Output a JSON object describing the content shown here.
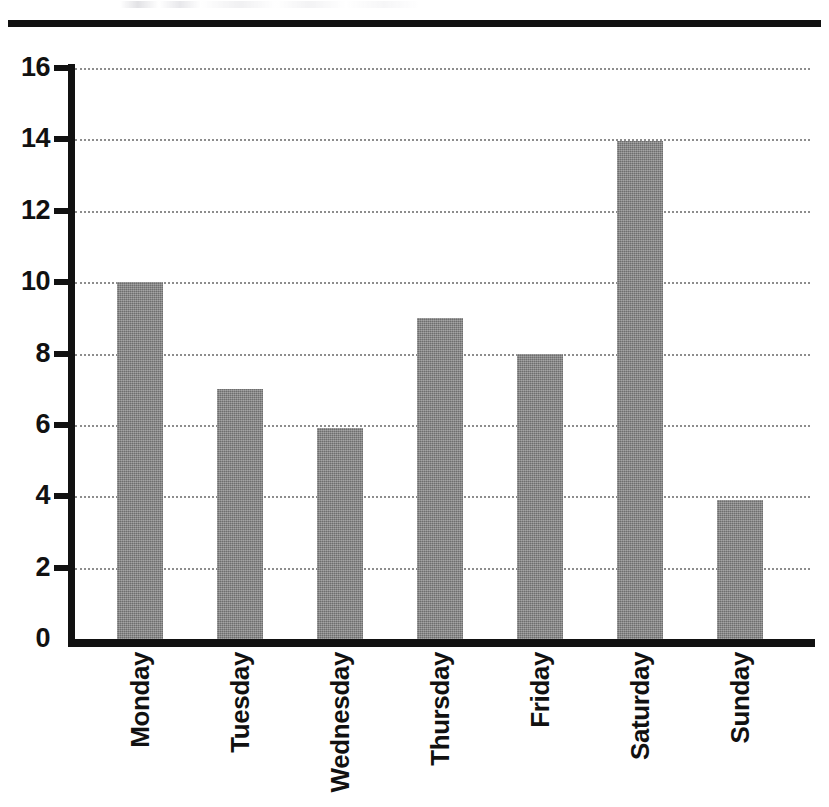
{
  "page": {
    "top_rule": "horizontal-rule",
    "background_color": "#ffffff"
  },
  "chart_data": {
    "type": "bar",
    "title": "",
    "subtitle": "",
    "xlabel": "",
    "ylabel": "",
    "categories": [
      "Monday",
      "Tuesday",
      "Wednesday",
      "Thursday",
      "Friday",
      "Saturday",
      "Sunday"
    ],
    "values": [
      10,
      7,
      5.9,
      9,
      8,
      13.95,
      3.9
    ],
    "value_labels": [
      "10",
      "7",
      "5.9",
      "9",
      "8",
      "13.95",
      "3.9"
    ],
    "ylim": [
      0,
      16
    ],
    "y_ticks": [
      0,
      2,
      4,
      6,
      8,
      10,
      12,
      14,
      16
    ],
    "y_tick_labels": [
      "0",
      "2",
      "4",
      "6",
      "8",
      "10",
      "12",
      "14",
      "16"
    ],
    "grid": true,
    "grid_axis": "y",
    "grid_style": "dotted",
    "grid_color": "#8d8d8d",
    "legend": false,
    "legend_position": "none",
    "bar_color": "#808080",
    "axis_color": "#111111",
    "tick_label_rotation": 90,
    "series": [
      {
        "name": "",
        "values": [
          10,
          7,
          5.9,
          9,
          8,
          13.95,
          3.9
        ]
      }
    ]
  }
}
